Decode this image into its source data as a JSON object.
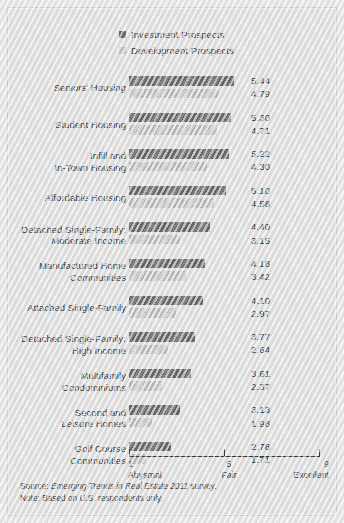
{
  "legend": {
    "items": [
      {
        "label": "Investment Prospects",
        "color": "#6e6e6e",
        "key": "investment"
      },
      {
        "label": "Development Prospects",
        "color": "#c3c3c3",
        "key": "development"
      }
    ]
  },
  "axis": {
    "ticks": [
      {
        "num": "1",
        "word": "Abysmal"
      },
      {
        "num": "5",
        "word": "Fair"
      },
      {
        "num": "9",
        "word": "Excellent"
      }
    ]
  },
  "footnote": {
    "source_prefix": "Source: ",
    "source_title": "Emerging Trends in Real Estate 2011",
    "source_suffix": " survey.",
    "note": "Note: Based on U.S. respondents only."
  },
  "chart_data": {
    "type": "bar",
    "title": "",
    "xlabel": "",
    "ylabel": "",
    "xlim": [
      1,
      9
    ],
    "grid": false,
    "legend_position": "top",
    "orientation": "horizontal",
    "categories": [
      "Seniors’ Housing",
      "Student Housing",
      "Infill and\nIn-Town Housing",
      "Affordable Housing",
      "Detached Single-Family:\nModerate Income",
      "Manufactured Home\nCommunities",
      "Attached Single-Family",
      "Detached Single-Family:\nHigh Income",
      "Multifamily\nCondominiums",
      "Second and\nLeisure Homes",
      "Golf Course\nCommunities"
    ],
    "series": [
      {
        "name": "Investment Prospects",
        "color": "#6e6e6e",
        "values": [
          5.44,
          5.3,
          5.22,
          5.1,
          4.4,
          4.18,
          4.1,
          3.77,
          3.61,
          3.13,
          2.78
        ],
        "labels": [
          "5.44",
          "5.30",
          "5.22",
          "5.10",
          "4.40",
          "4.18",
          "4.10",
          "3.77",
          "3.61",
          "3.13",
          "2.78"
        ]
      },
      {
        "name": "Development Prospects",
        "color": "#c3c3c3",
        "values": [
          4.79,
          4.71,
          4.3,
          4.58,
          3.15,
          3.42,
          2.97,
          2.64,
          2.37,
          1.98,
          1.71
        ],
        "labels": [
          "4.79",
          "4.71",
          "4.30",
          "4.58",
          "3.15",
          "3.42",
          "2.97",
          "2.64",
          "2.37",
          "1.98",
          "1.71"
        ]
      }
    ]
  }
}
